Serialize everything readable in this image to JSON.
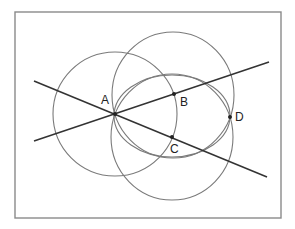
{
  "frame": {
    "x": 15,
    "y": 12,
    "width": 266,
    "height": 206
  },
  "circles": [
    {
      "name": "circle-a",
      "cx": 115,
      "cy": 114,
      "rx": 62,
      "ry": 62
    },
    {
      "name": "circle-b",
      "cx": 173,
      "cy": 95,
      "rx": 61,
      "ry": 63
    },
    {
      "name": "circle-c",
      "cx": 172,
      "cy": 137,
      "rx": 61,
      "ry": 63
    },
    {
      "name": "circle-middle",
      "cx": 172,
      "cy": 116,
      "rx": 58,
      "ry": 41
    }
  ],
  "lines": [
    {
      "name": "line-ac",
      "x1": 34,
      "y1": 81,
      "x2": 267,
      "y2": 177
    },
    {
      "name": "line-ab",
      "x1": 34,
      "y1": 141,
      "x2": 269,
      "y2": 62
    }
  ],
  "points": [
    {
      "label": "A",
      "x": 115,
      "y": 114,
      "lx": 101,
      "ly": 104
    },
    {
      "label": "B",
      "x": 174,
      "y": 94,
      "lx": 180,
      "ly": 106
    },
    {
      "label": "C",
      "x": 172,
      "y": 137,
      "lx": 170,
      "ly": 153
    },
    {
      "label": "D",
      "x": 230,
      "y": 117,
      "lx": 235,
      "ly": 121
    }
  ],
  "labels": {
    "A": "A",
    "B": "B",
    "C": "C",
    "D": "D"
  }
}
